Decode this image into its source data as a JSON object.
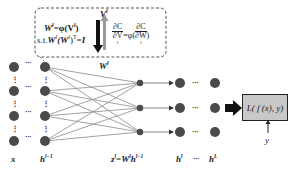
{
  "diagram": {
    "constraint_box": {
      "line1": "W",
      "line1_sup": "l",
      "line1_rest": "=φ(V",
      "line1_rest_sup": "l",
      "line1_end": ")",
      "line2_prefix": "s.t.",
      "line2_expr": "W",
      "line2_sup": "l",
      "line2_mid": "(W",
      "line2_mid_sup": "l",
      "line2_end": ")",
      "line2_T": "T",
      "line2_rhs": "=I",
      "v_label": "V",
      "v_sup": "l",
      "grad_lhs_num": "∂C",
      "grad_lhs_den": "∂V",
      "grad_lhs_den_sup": "l",
      "grad_mid": "=φ(",
      "grad_rhs_num": "∂C",
      "grad_rhs_den": "∂W",
      "grad_rhs_den_sup": "l",
      "grad_end": ")"
    },
    "w_label": "W",
    "w_sup": "l",
    "bottom_labels": {
      "x": "x",
      "h_prev": "h",
      "h_prev_sup": "l−1",
      "z_eq": "z",
      "z_sup": "l",
      "z_eq_rest": "=W",
      "z_eq_rest_sup": "l",
      "z_eq_h": "h",
      "z_eq_h_sup": "l−1",
      "h_l": "h",
      "h_l_sup": "l",
      "ellipsis": "···",
      "h_L": "h",
      "h_L_sup": "L"
    },
    "loss_box": {
      "label": "L( f (x), y)"
    },
    "y_label": "y",
    "ellipsis_h": "···",
    "ellipsis_v": "⋮",
    "colors": {
      "node": "#4a4a4a",
      "edge": "#8a8a8a",
      "loss_fill": "#c8c8c8",
      "black_arrow": "#111111",
      "gray_arrow": "#9a9a9a"
    }
  }
}
